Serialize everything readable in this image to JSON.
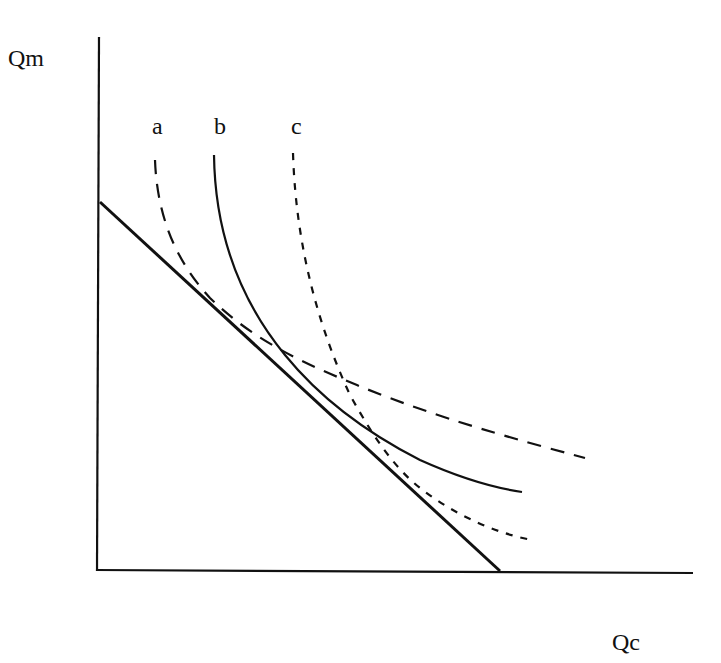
{
  "diagram": {
    "type": "indifference-curves-with-budget-line",
    "axes": {
      "y_label": "Qm",
      "x_label": "Qc"
    },
    "curves": [
      {
        "id": "a",
        "label": "a",
        "style": "long-dash",
        "dasharray": "14,10"
      },
      {
        "id": "b",
        "label": "b",
        "style": "solid",
        "dasharray": ""
      },
      {
        "id": "c",
        "label": "c",
        "style": "short-dash",
        "dasharray": "7,8"
      }
    ],
    "budget_line": {
      "style": "solid-thick"
    },
    "colors": {
      "ink": "#111111",
      "background": "#ffffff"
    }
  }
}
